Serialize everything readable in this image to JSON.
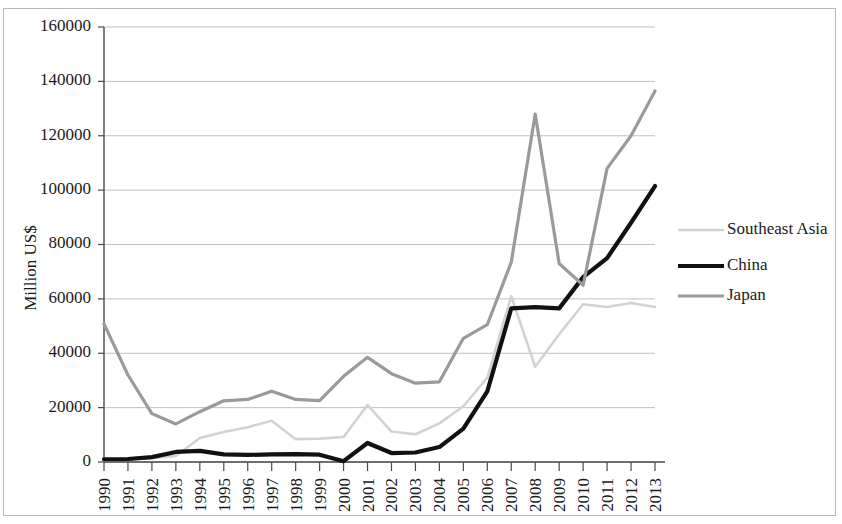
{
  "figure": {
    "width": 842,
    "height": 524,
    "background": "#ffffff",
    "border_color": "#b9b9b9"
  },
  "chart_data": {
    "type": "line",
    "title": "",
    "xlabel": "",
    "ylabel": "Million US$",
    "ylim": [
      0,
      160000
    ],
    "ytick_step": 20000,
    "ytick_labels": [
      "0",
      "20000",
      "40000",
      "60000",
      "80000",
      "100000",
      "120000",
      "140000",
      "160000"
    ],
    "ytick_values": [
      0,
      20000,
      40000,
      60000,
      80000,
      100000,
      120000,
      140000,
      160000
    ],
    "grid": "horizontal",
    "legend_position": "right",
    "categories": [
      "1990",
      "1991",
      "1992",
      "1993",
      "1994",
      "1995",
      "1996",
      "1997",
      "1998",
      "1999",
      "2000",
      "2001",
      "2002",
      "2003",
      "2004",
      "2005",
      "2006",
      "2007",
      "2008",
      "2009",
      "2010",
      "2011",
      "2012",
      "2013"
    ],
    "series": [
      {
        "name": "Southeast Asia",
        "color": "#d2d2d2",
        "width": 2.6,
        "values": [
          600,
          900,
          1400,
          2200,
          8800,
          11000,
          12800,
          15200,
          8400,
          8600,
          9200,
          21000,
          11200,
          10200,
          14200,
          20500,
          31000,
          61000,
          35000,
          47000,
          58000,
          57000,
          58500,
          57000
        ]
      },
      {
        "name": "China",
        "color": "#111111",
        "width": 4.2,
        "values": [
          1000,
          1100,
          1800,
          3700,
          4100,
          2800,
          2600,
          2800,
          2900,
          2700,
          300,
          7000,
          3300,
          3500,
          5500,
          12300,
          26000,
          56500,
          57000,
          56500,
          68000,
          75000,
          88000,
          101500
        ]
      },
      {
        "name": "Japan",
        "color": "#9a9a9a",
        "width": 3.2,
        "values": [
          50800,
          32000,
          17800,
          14000,
          18500,
          22500,
          23000,
          26000,
          23000,
          22600,
          31500,
          38500,
          32500,
          29000,
          29500,
          45500,
          50500,
          73500,
          128000,
          73000,
          65000,
          108000,
          120000,
          136500
        ]
      }
    ]
  },
  "legend": {
    "entries": [
      {
        "label": "Southeast Asia"
      },
      {
        "label": "China"
      },
      {
        "label": "Japan"
      }
    ]
  },
  "axes": {
    "y_title": "Million US$"
  }
}
